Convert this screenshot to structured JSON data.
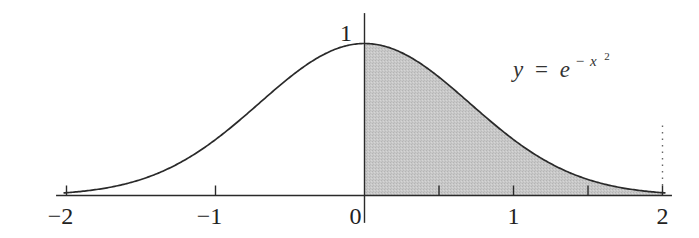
{
  "chart_data": {
    "type": "area",
    "title": "",
    "function": "y = e^(-x^2)",
    "annotation": {
      "lhs": "y",
      "equals": "=",
      "base": "e",
      "exponent_sign": "−",
      "exponent_var": "x",
      "exponent_power": "2"
    },
    "xlabel": "",
    "ylabel": "",
    "xlim": [
      -2.07,
      2.05
    ],
    "ylim": [
      -0.18,
      1.2
    ],
    "x_ticks": [
      -2,
      -1,
      0,
      1,
      2
    ],
    "x_tick_labels": [
      "−2",
      "−1",
      "0",
      "1",
      "2"
    ],
    "x_minor_ticks": [
      0.5,
      1.5
    ],
    "y_tick_labels": [
      {
        "value": 1,
        "label": "1"
      }
    ],
    "shaded_region": {
      "from": 0,
      "to": 2,
      "fill": "#c4c4c4"
    },
    "dotted_line": {
      "x": 2,
      "y_top": 0.46
    },
    "grid": false,
    "legend": null,
    "curve_samples": {
      "x": [
        -2,
        -1.5,
        -1,
        -0.5,
        0,
        0.5,
        1,
        1.5,
        2
      ],
      "y": [
        0.018,
        0.105,
        0.368,
        0.779,
        1.0,
        0.779,
        0.368,
        0.105,
        0.018
      ]
    },
    "colors": {
      "curve": "#2a2a2a",
      "axis": "#2a2a2a",
      "shade": "#c4c4c4",
      "text": "#222222"
    }
  }
}
